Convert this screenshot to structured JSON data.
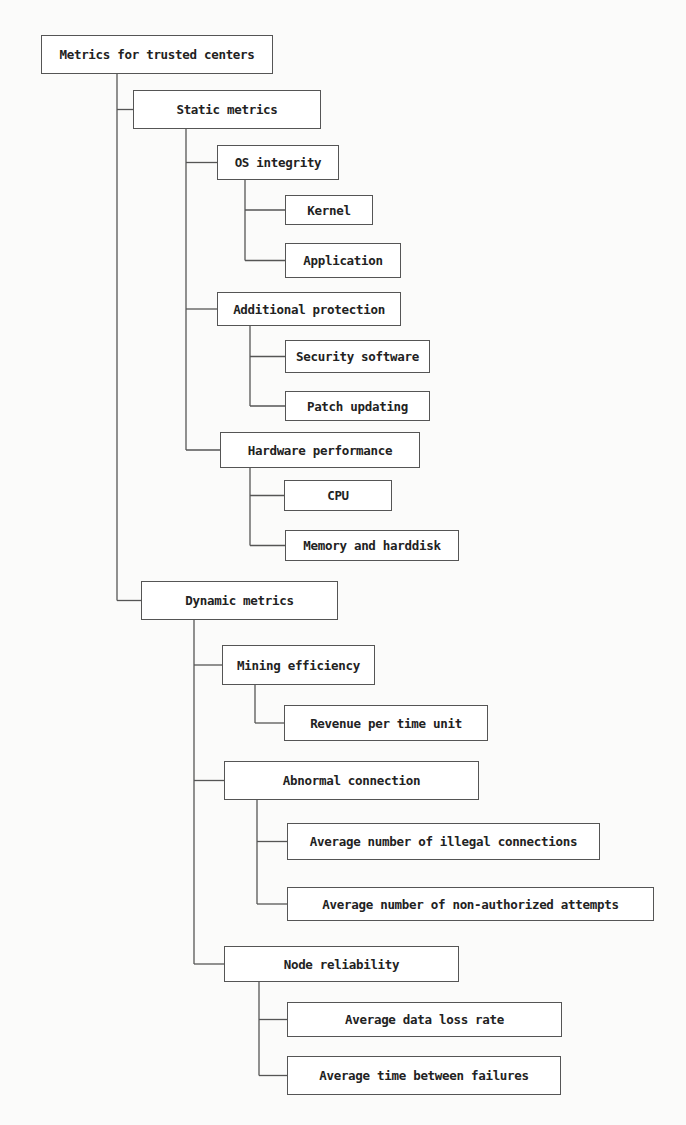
{
  "diagram": {
    "type": "tree",
    "title": "Metrics for trusted centers",
    "nodes": [
      {
        "id": "root",
        "label": "Metrics for trusted centers",
        "x": 41,
        "y": 35,
        "w": 232,
        "h": 39
      },
      {
        "id": "static",
        "label": "Static metrics",
        "x": 133,
        "y": 90,
        "w": 188,
        "h": 39
      },
      {
        "id": "os",
        "label": "OS integrity",
        "x": 217,
        "y": 145,
        "w": 122,
        "h": 35
      },
      {
        "id": "kernel",
        "label": "Kernel",
        "x": 285,
        "y": 195,
        "w": 88,
        "h": 30
      },
      {
        "id": "app",
        "label": "Application",
        "x": 285,
        "y": 243,
        "w": 116,
        "h": 35
      },
      {
        "id": "addprot",
        "label": "Additional protection",
        "x": 217,
        "y": 292,
        "w": 184,
        "h": 34
      },
      {
        "id": "secsw",
        "label": "Security software",
        "x": 285,
        "y": 340,
        "w": 145,
        "h": 33
      },
      {
        "id": "patch",
        "label": "Patch updating",
        "x": 285,
        "y": 391,
        "w": 145,
        "h": 30
      },
      {
        "id": "hw",
        "label": "Hardware performance",
        "x": 220,
        "y": 432,
        "w": 200,
        "h": 36
      },
      {
        "id": "cpu",
        "label": "CPU",
        "x": 284,
        "y": 480,
        "w": 108,
        "h": 31
      },
      {
        "id": "mem",
        "label": "Memory and harddisk",
        "x": 285,
        "y": 530,
        "w": 174,
        "h": 31
      },
      {
        "id": "dynamic",
        "label": "Dynamic metrics",
        "x": 141,
        "y": 581,
        "w": 197,
        "h": 39
      },
      {
        "id": "mining",
        "label": "Mining efficiency",
        "x": 222,
        "y": 645,
        "w": 153,
        "h": 40
      },
      {
        "id": "revenue",
        "label": "Revenue per time unit",
        "x": 284,
        "y": 705,
        "w": 204,
        "h": 36
      },
      {
        "id": "abnormal",
        "label": "Abnormal connection",
        "x": 224,
        "y": 761,
        "w": 255,
        "h": 39
      },
      {
        "id": "illegal",
        "label": "Average number of illegal connections",
        "x": 287,
        "y": 823,
        "w": 313,
        "h": 37
      },
      {
        "id": "nonauth",
        "label": "Average number of non-authorized attempts",
        "x": 287,
        "y": 887,
        "w": 367,
        "h": 34
      },
      {
        "id": "node",
        "label": "Node reliability",
        "x": 224,
        "y": 946,
        "w": 235,
        "h": 36
      },
      {
        "id": "dataloss",
        "label": "Average data loss rate",
        "x": 287,
        "y": 1002,
        "w": 275,
        "h": 35
      },
      {
        "id": "mtbf",
        "label": "Average time between failures",
        "x": 287,
        "y": 1056,
        "w": 274,
        "h": 39
      }
    ],
    "edges": [
      {
        "from": "root",
        "to": "static"
      },
      {
        "from": "root",
        "to": "dynamic"
      },
      {
        "from": "static",
        "to": "os"
      },
      {
        "from": "static",
        "to": "addprot"
      },
      {
        "from": "static",
        "to": "hw"
      },
      {
        "from": "os",
        "to": "kernel"
      },
      {
        "from": "os",
        "to": "app"
      },
      {
        "from": "addprot",
        "to": "secsw"
      },
      {
        "from": "addprot",
        "to": "patch"
      },
      {
        "from": "hw",
        "to": "cpu"
      },
      {
        "from": "hw",
        "to": "mem"
      },
      {
        "from": "dynamic",
        "to": "mining"
      },
      {
        "from": "dynamic",
        "to": "abnormal"
      },
      {
        "from": "dynamic",
        "to": "node"
      },
      {
        "from": "mining",
        "to": "revenue"
      },
      {
        "from": "abnormal",
        "to": "illegal"
      },
      {
        "from": "abnormal",
        "to": "nonauth"
      },
      {
        "from": "node",
        "to": "dataloss"
      },
      {
        "from": "node",
        "to": "mtbf"
      }
    ],
    "trunks": [
      {
        "parent": "root",
        "x": 117
      },
      {
        "parent": "static",
        "x": 186
      },
      {
        "parent": "os",
        "x": 245
      },
      {
        "parent": "addprot",
        "x": 250
      },
      {
        "parent": "hw",
        "x": 250
      },
      {
        "parent": "dynamic",
        "x": 194
      },
      {
        "parent": "mining",
        "x": 255
      },
      {
        "parent": "abnormal",
        "x": 257
      },
      {
        "parent": "node",
        "x": 259
      }
    ],
    "colors": {
      "line": "#555555",
      "box_border": "#555555",
      "text": "#222222",
      "background": "#fbfbfa"
    }
  }
}
